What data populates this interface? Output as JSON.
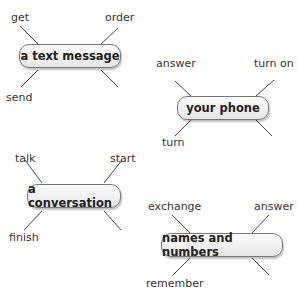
{
  "diagrams": [
    {
      "center": "a text message",
      "top_left": "get",
      "top_right": "order",
      "bottom_left": "send"
    },
    {
      "center": "your phone",
      "top_left": "answer",
      "top_right": "turn on",
      "bottom_left": "turn"
    },
    {
      "center": "a conversation",
      "top_left": "talk",
      "top_right": "start",
      "bottom_left": "finish"
    },
    {
      "center": "names and numbers",
      "top_left": "exchange",
      "top_right": "answer",
      "bottom_left": "remember"
    }
  ]
}
